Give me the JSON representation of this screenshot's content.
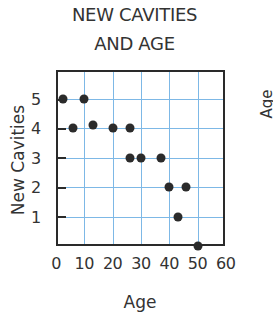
{
  "chart_data": {
    "type": "scatter",
    "title_lines": [
      "NEW CAVITIES",
      "AND AGE"
    ],
    "xlabel": "Age",
    "ylabel": "New Cavities",
    "xlim": [
      0,
      60
    ],
    "ylim": [
      0,
      5
    ],
    "x_ticks": [
      "0",
      "10",
      "20",
      "30",
      "40",
      "50",
      "60"
    ],
    "y_ticks": [
      "1",
      "2",
      "3",
      "4",
      "5"
    ],
    "grid": true,
    "points": [
      {
        "x": 2.5,
        "y": 5
      },
      {
        "x": 10,
        "y": 5
      },
      {
        "x": 6,
        "y": 4
      },
      {
        "x": 13,
        "y": 4.1
      },
      {
        "x": 20,
        "y": 4
      },
      {
        "x": 26,
        "y": 4
      },
      {
        "x": 26,
        "y": 3
      },
      {
        "x": 30,
        "y": 3
      },
      {
        "x": 37,
        "y": 3
      },
      {
        "x": 40,
        "y": 2
      },
      {
        "x": 46,
        "y": 2
      },
      {
        "x": 43,
        "y": 1
      },
      {
        "x": 50,
        "y": 0
      }
    ],
    "colors": {
      "point": "#2b2b2b",
      "grid": "#7db8e6",
      "axis": "#2a2a2a"
    }
  },
  "clipped_text": "Age"
}
